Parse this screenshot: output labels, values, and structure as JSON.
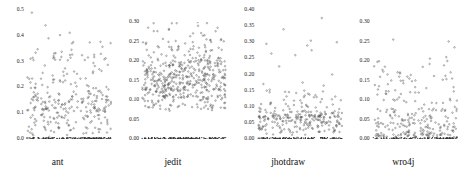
{
  "figure": {
    "type": "scatter-panel-grid",
    "width": 461,
    "height": 170,
    "background": "#ffffff",
    "panel_count": 4
  },
  "panels": [
    {
      "name": "ant",
      "caption": "ant",
      "y_ticks": [
        "0.0",
        "0.1",
        "0.2",
        "0.3",
        "0.4",
        "0.5"
      ],
      "y_values": [
        0.0,
        0.1,
        0.2,
        0.3,
        0.4,
        0.5
      ],
      "ylim": [
        0.0,
        0.5
      ],
      "plot": {
        "x": 26,
        "y": 9,
        "w": 86,
        "h": 131
      },
      "tick_top_y": 10,
      "tick_bottom_y": 139,
      "baseline_value": 0.0,
      "band_value": 0.125,
      "cloud_low": 0.01,
      "cloud_high": 0.26,
      "outliers": [
        0.49,
        0.305,
        0.285,
        0.27
      ],
      "seed": 11
    },
    {
      "name": "jedit",
      "caption": "jedit",
      "y_ticks": [
        "0.00",
        "0.05",
        "0.10",
        "0.15",
        "0.20",
        "0.25",
        "0.30"
      ],
      "y_values": [
        0.0,
        0.05,
        0.1,
        0.15,
        0.2,
        0.25,
        0.3
      ],
      "ylim": [
        0.0,
        0.3
      ],
      "plot": {
        "x": 26,
        "y": 21,
        "w": 86,
        "h": 119
      },
      "tick_top_y": 22,
      "tick_bottom_y": 139,
      "baseline_value": 0.0,
      "band_value": 0.145,
      "cloud_low": 0.075,
      "cloud_high": 0.215,
      "outliers": [
        0.3,
        0.265,
        0.245,
        0.235
      ],
      "seed": 23
    },
    {
      "name": "jhotdraw",
      "caption": "jhotdraw",
      "y_ticks": [
        "0.00",
        "0.05",
        "0.10",
        "0.15",
        "0.20",
        "0.25",
        "0.30",
        "0.35",
        "0.40"
      ],
      "y_values": [
        0.0,
        0.05,
        0.1,
        0.15,
        0.2,
        0.25,
        0.3,
        0.35,
        0.4
      ],
      "ylim": [
        0.0,
        0.4
      ],
      "plot": {
        "x": 26,
        "y": 9,
        "w": 86,
        "h": 131
      },
      "tick_top_y": 10,
      "tick_bottom_y": 139,
      "baseline_value": 0.0,
      "band_value": 0.06,
      "cloud_low": 0.02,
      "cloud_high": 0.11,
      "outliers": [
        0.375,
        0.34,
        0.305,
        0.3,
        0.295,
        0.29,
        0.275,
        0.265,
        0.26,
        0.225,
        0.2,
        0.175,
        0.15,
        0.145,
        0.13
      ],
      "seed": 37
    },
    {
      "name": "wro4j",
      "caption": "wro4j",
      "y_ticks": [
        "0.00",
        "0.05",
        "0.10",
        "0.15",
        "0.20",
        "0.25",
        "0.30"
      ],
      "y_values": [
        0.0,
        0.05,
        0.1,
        0.15,
        0.2,
        0.25,
        0.3
      ],
      "ylim": [
        0.0,
        0.3
      ],
      "plot": {
        "x": 26,
        "y": 21,
        "w": 86,
        "h": 119
      },
      "tick_top_y": 22,
      "tick_bottom_y": 139,
      "baseline_value": 0.0,
      "band_value": 0.03,
      "cloud_low": 0.005,
      "cloud_high": 0.13,
      "outliers": [
        0.305,
        0.255,
        0.25,
        0.235,
        0.21,
        0.2,
        0.185,
        0.16,
        0.155,
        0.15
      ],
      "seed": 59
    }
  ],
  "chart_data": {
    "type": "scatter",
    "title": "",
    "xlabel": "",
    "ylabel": "",
    "grid": false,
    "legend": "none",
    "panel_layout": "1x4",
    "panels": [
      {
        "name": "ant",
        "ylim": [
          0.0,
          0.5
        ],
        "yticks": [
          0.0,
          0.1,
          0.2,
          0.3,
          0.4,
          0.5
        ],
        "n_points": 430,
        "baseline_fraction": 0.34,
        "dense_band_center": 0.125,
        "bulk_range": [
          0.01,
          0.26
        ],
        "max_value": 0.49
      },
      {
        "name": "jedit",
        "ylim": [
          0.0,
          0.3
        ],
        "yticks": [
          0.0,
          0.05,
          0.1,
          0.15,
          0.2,
          0.25,
          0.3
        ],
        "n_points": 640,
        "baseline_fraction": 0.22,
        "dense_band_center": 0.145,
        "bulk_range": [
          0.075,
          0.215
        ],
        "max_value": 0.3
      },
      {
        "name": "jhotdraw",
        "ylim": [
          0.0,
          0.4
        ],
        "yticks": [
          0.0,
          0.05,
          0.1,
          0.15,
          0.2,
          0.25,
          0.3,
          0.35,
          0.4
        ],
        "n_points": 390,
        "baseline_fraction": 0.3,
        "dense_band_center": 0.06,
        "bulk_range": [
          0.02,
          0.11
        ],
        "max_value": 0.375
      },
      {
        "name": "wro4j",
        "ylim": [
          0.0,
          0.3
        ],
        "yticks": [
          0.0,
          0.05,
          0.1,
          0.15,
          0.2,
          0.25,
          0.3
        ],
        "n_points": 360,
        "baseline_fraction": 0.32,
        "dense_band_center": 0.03,
        "bulk_range": [
          0.005,
          0.13
        ],
        "max_value": 0.305
      }
    ]
  }
}
